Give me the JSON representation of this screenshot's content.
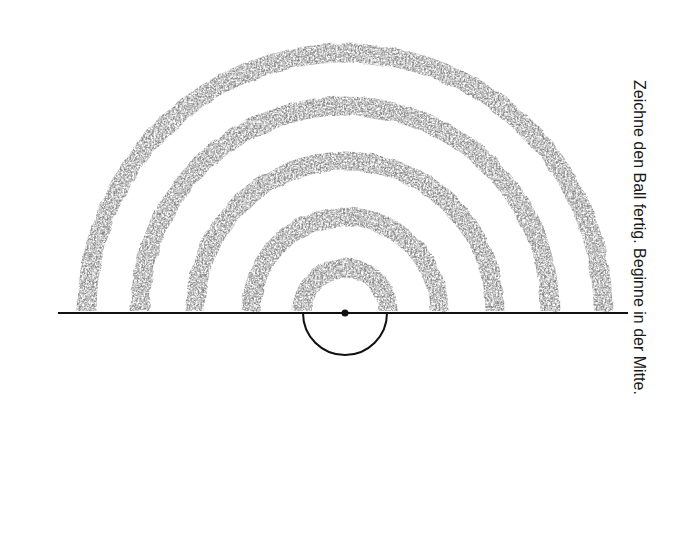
{
  "caption": "Zeichne den Ball fertig. Beginne in der Mitte.",
  "figure": {
    "center": [
      345,
      313
    ],
    "baseline": {
      "x1": 58,
      "x2": 628,
      "y": 313
    },
    "ring_radii": [
      258,
      205,
      150,
      94,
      43
    ],
    "ring_width": 19,
    "ring_color": "#8a8a8a",
    "ball_radius": 42,
    "line_color": "#111111"
  }
}
